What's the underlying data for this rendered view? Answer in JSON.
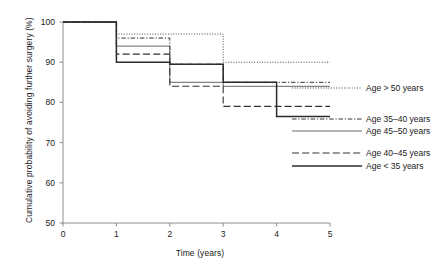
{
  "chart_data": {
    "type": "line",
    "subtype": "kaplan-meier-step",
    "title": "",
    "xlabel": "Time (years)",
    "ylabel": "Cumulative probability of avoiding further surgery (%)",
    "xlim": [
      0,
      5
    ],
    "ylim": [
      50,
      100
    ],
    "xticks": [
      0,
      1,
      2,
      3,
      4,
      5
    ],
    "xtick_labels": [
      "0",
      "1",
      "2",
      "3",
      "4",
      "5"
    ],
    "yticks": [
      50,
      60,
      70,
      80,
      90,
      100
    ],
    "ytick_labels": [
      "50",
      "60",
      "70",
      "80",
      "90",
      "100"
    ],
    "grid": false,
    "legend_position": "right-inline",
    "series": [
      {
        "name": "Age > 50 years",
        "label": "Age > 50 years",
        "style": "dotted",
        "color": "#444444",
        "width": 1.0,
        "x": [
          0,
          1,
          1,
          3,
          3,
          5
        ],
        "y": [
          100,
          100,
          97,
          97,
          90,
          90
        ],
        "steps": [
          {
            "t": 0,
            "value": 100
          },
          {
            "t": 1,
            "value": 97
          },
          {
            "t": 3,
            "value": 90
          },
          {
            "t": 5,
            "value": 90
          }
        ]
      },
      {
        "name": "Age 35-40 years",
        "label": "Age 35–40 years",
        "style": "dash-dot",
        "color": "#333333",
        "width": 1.0,
        "x": [
          0,
          1,
          1,
          2,
          2,
          3,
          3,
          5
        ],
        "y": [
          100,
          100,
          96,
          96,
          89.5,
          89.5,
          85,
          85
        ],
        "steps": [
          {
            "t": 0,
            "value": 100
          },
          {
            "t": 1,
            "value": 96
          },
          {
            "t": 2,
            "value": 89.5
          },
          {
            "t": 3,
            "value": 85
          },
          {
            "t": 5,
            "value": 85
          }
        ]
      },
      {
        "name": "Age 45-50 years",
        "label": "Age 45–50 years",
        "style": "thin-solid",
        "color": "#555555",
        "width": 0.9,
        "x": [
          0,
          1,
          1,
          2,
          2,
          3,
          3,
          5
        ],
        "y": [
          100,
          100,
          94,
          94,
          85,
          85,
          84,
          84
        ],
        "steps": [
          {
            "t": 0,
            "value": 100
          },
          {
            "t": 1,
            "value": 94
          },
          {
            "t": 2,
            "value": 85
          },
          {
            "t": 3,
            "value": 84
          },
          {
            "t": 5,
            "value": 84
          }
        ]
      },
      {
        "name": "Age 40-45 years",
        "label": "Age 40–45 years",
        "style": "long-dash",
        "color": "#333333",
        "width": 1.1,
        "x": [
          0,
          1,
          1,
          2,
          2,
          3,
          3,
          5
        ],
        "y": [
          100,
          100,
          92,
          92,
          84,
          84,
          79,
          79
        ],
        "steps": [
          {
            "t": 0,
            "value": 100
          },
          {
            "t": 1,
            "value": 92
          },
          {
            "t": 2,
            "value": 84
          },
          {
            "t": 3,
            "value": 79
          },
          {
            "t": 5,
            "value": 79
          }
        ]
      },
      {
        "name": "Age < 35 years",
        "label": "Age < 35 years",
        "style": "solid",
        "color": "#2b2b2b",
        "width": 1.5,
        "x": [
          0,
          1,
          1,
          2,
          2,
          3,
          3,
          4,
          4,
          5
        ],
        "y": [
          100,
          100,
          90,
          90,
          89.5,
          89.5,
          85,
          85,
          76.5,
          76.5
        ],
        "steps": [
          {
            "t": 0,
            "value": 100
          },
          {
            "t": 1,
            "value": 90
          },
          {
            "t": 2,
            "value": 89.5
          },
          {
            "t": 3,
            "value": 85
          },
          {
            "t": 4,
            "value": 76.5
          },
          {
            "t": 5,
            "value": 76.5
          }
        ]
      }
    ],
    "legend_entries": [
      {
        "label": "Age > 50 years",
        "style": "dotted",
        "y": 88
      },
      {
        "label": "Age 35–40 years",
        "style": "dash-dot",
        "y": 119
      },
      {
        "label": "Age 45–50 years",
        "style": "thin-solid",
        "y": 131
      },
      {
        "label": "Age 40–45 years",
        "style": "long-dash",
        "y": 153
      },
      {
        "label": "Age < 35 years",
        "style": "solid",
        "y": 166
      }
    ]
  }
}
